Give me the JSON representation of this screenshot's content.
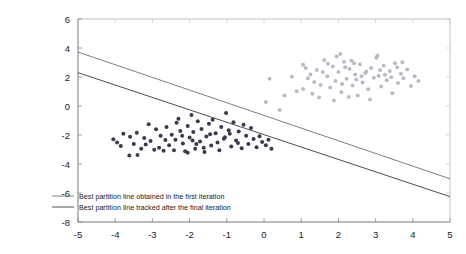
{
  "chart_data": {
    "type": "scatter",
    "title": "",
    "xlabel": "",
    "ylabel": "",
    "xlim": [
      -5,
      5
    ],
    "ylim": [
      -8,
      6
    ],
    "grid": false,
    "xticks": [
      -5,
      -4,
      -3,
      -2,
      -1,
      0,
      1,
      2,
      3,
      4,
      5
    ],
    "xticklabels": [
      "-5",
      "-4",
      "-3",
      "-2",
      "-1",
      "0",
      "1",
      "2",
      "3",
      "4",
      "5"
    ],
    "yticks": [
      -8,
      -6,
      -4,
      -2,
      0,
      2,
      4,
      6
    ],
    "yticklabels": [
      "-8",
      "-6",
      "-4",
      "-2",
      "0",
      "2",
      "4",
      "6"
    ],
    "legend_position": "lower-left-inside",
    "series": [
      {
        "name": "class-1-points",
        "type": "scatter",
        "color": "#3a3a4f",
        "marker": "dot",
        "marker_size": 2.0,
        "points": [
          [
            -4.05,
            -2.3
          ],
          [
            -3.85,
            -2.75
          ],
          [
            -3.78,
            -1.92
          ],
          [
            -3.62,
            -3.42
          ],
          [
            -3.5,
            -2.62
          ],
          [
            -3.42,
            -1.85
          ],
          [
            -3.3,
            -2.95
          ],
          [
            -3.22,
            -2.2
          ],
          [
            -3.1,
            -1.25
          ],
          [
            -3.05,
            -2.42
          ],
          [
            -2.95,
            -3.02
          ],
          [
            -2.9,
            -1.6
          ],
          [
            -2.82,
            -2.88
          ],
          [
            -2.78,
            -2.05
          ],
          [
            -2.7,
            -3.08
          ],
          [
            -2.62,
            -1.45
          ],
          [
            -2.55,
            -2.7
          ],
          [
            -2.48,
            -1.98
          ],
          [
            -2.42,
            -3.05
          ],
          [
            -2.38,
            -2.32
          ],
          [
            -2.3,
            -0.88
          ],
          [
            -2.25,
            -1.72
          ],
          [
            -2.18,
            -2.58
          ],
          [
            -2.12,
            -3.12
          ],
          [
            -2.05,
            -1.38
          ],
          [
            -2.0,
            -2.18
          ],
          [
            -1.95,
            -0.62
          ],
          [
            -1.9,
            -1.8
          ],
          [
            -1.85,
            -2.95
          ],
          [
            -1.78,
            -1.05
          ],
          [
            -1.72,
            -2.45
          ],
          [
            -1.68,
            -1.58
          ],
          [
            -1.6,
            -3.18
          ],
          [
            -1.55,
            -2.1
          ],
          [
            -1.48,
            -1.22
          ],
          [
            -1.42,
            -2.72
          ],
          [
            -1.38,
            -0.95
          ],
          [
            -1.3,
            -1.88
          ],
          [
            -1.25,
            -2.52
          ],
          [
            -1.2,
            -3.05
          ],
          [
            -1.15,
            -1.45
          ],
          [
            -1.08,
            -2.25
          ],
          [
            -1.02,
            -0.48
          ],
          [
            -0.95,
            -1.68
          ],
          [
            -0.88,
            -2.8
          ],
          [
            -0.82,
            -1.12
          ],
          [
            -0.75,
            -2.38
          ],
          [
            -0.68,
            -1.75
          ],
          [
            -0.6,
            -2.92
          ],
          [
            -0.55,
            -1.3
          ],
          [
            -0.48,
            -2.05
          ],
          [
            -0.42,
            -2.62
          ],
          [
            -0.35,
            -1.52
          ],
          [
            -0.28,
            -2.28
          ],
          [
            -0.2,
            -2.85
          ],
          [
            -0.12,
            -2.08
          ],
          [
            -0.05,
            -2.48
          ],
          [
            0.05,
            -2.7
          ],
          [
            0.12,
            -2.32
          ],
          [
            0.2,
            -2.95
          ],
          [
            -3.95,
            -2.52
          ],
          [
            -3.6,
            -2.12
          ],
          [
            -2.65,
            -2.35
          ],
          [
            -2.2,
            -2.05
          ],
          [
            -1.82,
            -2.62
          ],
          [
            -1.45,
            -1.95
          ],
          [
            -1.05,
            -2.15
          ],
          [
            -0.7,
            -2.55
          ],
          [
            -3.18,
            -2.65
          ],
          [
            -2.35,
            -1.15
          ],
          [
            -1.92,
            -2.38
          ],
          [
            -0.92,
            -1.92
          ],
          [
            -3.4,
            -3.38
          ],
          [
            -2.05,
            -3.22
          ],
          [
            -1.62,
            -2.88
          ]
        ]
      },
      {
        "name": "class-2-points",
        "type": "scatter",
        "color": "#b9bcc8",
        "marker": "dot",
        "marker_size": 2.0,
        "points": [
          [
            1.05,
            1.18
          ],
          [
            1.18,
            1.92
          ],
          [
            1.3,
            0.85
          ],
          [
            1.42,
            2.48
          ],
          [
            1.52,
            1.45
          ],
          [
            1.62,
            3.18
          ],
          [
            1.7,
            2.05
          ],
          [
            1.78,
            1.28
          ],
          [
            1.85,
            2.72
          ],
          [
            1.92,
            1.72
          ],
          [
            2.0,
            2.35
          ],
          [
            2.08,
            0.95
          ],
          [
            2.15,
            3.05
          ],
          [
            2.22,
            1.88
          ],
          [
            2.3,
            2.55
          ],
          [
            2.38,
            1.42
          ],
          [
            2.45,
            2.18
          ],
          [
            2.52,
            0.72
          ],
          [
            2.58,
            2.88
          ],
          [
            2.65,
            1.62
          ],
          [
            2.72,
            2.28
          ],
          [
            2.8,
            1.15
          ],
          [
            2.88,
            2.62
          ],
          [
            2.95,
            1.95
          ],
          [
            3.02,
            3.32
          ],
          [
            3.08,
            2.08
          ],
          [
            3.15,
            1.35
          ],
          [
            3.22,
            2.78
          ],
          [
            3.3,
            1.78
          ],
          [
            3.38,
            2.42
          ],
          [
            3.45,
            0.88
          ],
          [
            3.52,
            2.95
          ],
          [
            3.6,
            1.58
          ],
          [
            3.68,
            2.22
          ],
          [
            3.75,
            1.92
          ],
          [
            3.85,
            2.52
          ],
          [
            3.95,
            1.38
          ],
          [
            4.05,
            2.05
          ],
          [
            0.75,
            2.02
          ],
          [
            0.88,
            1.02
          ],
          [
            1.12,
            2.62
          ],
          [
            1.35,
            1.65
          ],
          [
            1.48,
            0.58
          ],
          [
            1.95,
            3.42
          ],
          [
            2.1,
            1.52
          ],
          [
            2.35,
            3.12
          ],
          [
            2.62,
            2.05
          ],
          [
            2.85,
            0.45
          ],
          [
            3.12,
            2.48
          ],
          [
            3.42,
            1.98
          ],
          [
            3.72,
            3.02
          ],
          [
            4.15,
            1.72
          ],
          [
            1.25,
            2.18
          ],
          [
            1.58,
            2.35
          ],
          [
            2.18,
            2.68
          ],
          [
            2.48,
            1.82
          ],
          [
            2.75,
            2.38
          ],
          [
            3.25,
            2.15
          ],
          [
            3.58,
            2.68
          ],
          [
            1.05,
            2.85
          ],
          [
            1.88,
            0.38
          ],
          [
            2.28,
            0.62
          ],
          [
            0.15,
            1.88
          ],
          [
            0.55,
            0.72
          ],
          [
            2.05,
            3.58
          ],
          [
            3.05,
            3.48
          ],
          [
            1.72,
            2.92
          ],
          [
            2.42,
            2.95
          ],
          [
            0.05,
            0.28
          ],
          [
            0.42,
            -0.28
          ]
        ]
      }
    ],
    "lines": [
      {
        "name": "best-partition-line-first-iteration",
        "label": "Best partition line obtained in the first iteration",
        "color": "#6e6e78",
        "width": 0.9,
        "x0": -5,
        "y0": 3.72,
        "x1": 5,
        "y1": -5.02
      },
      {
        "name": "best-partition-line-final-iteration",
        "label": "Best partition line tracked after the final iteration",
        "color": "#3a3a44",
        "width": 0.9,
        "x0": -5,
        "y0": 2.3,
        "x1": 5,
        "y1": -6.25
      }
    ],
    "legend": [
      {
        "label": "Best partition line obtained in the first iteration",
        "color": "#6e6e78"
      },
      {
        "label": "Best partition line tracked after the final iteration",
        "color": "#3a3a44"
      }
    ]
  },
  "axes": {
    "left": 78,
    "right": 450,
    "top": 19,
    "bottom": 222
  }
}
